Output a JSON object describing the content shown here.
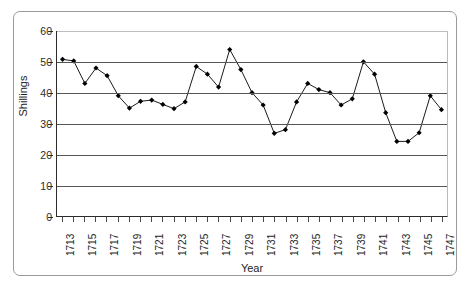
{
  "chart_data": {
    "type": "line",
    "title": "",
    "xlabel": "Year",
    "ylabel": "Shillings",
    "xlim": [
      1712.5,
      1747.5
    ],
    "ylim": [
      0,
      60
    ],
    "grid": true,
    "legend": false,
    "marker": "diamond",
    "line_color": "#000000",
    "marker_color": "#000000",
    "y_ticks": [
      0,
      10,
      20,
      30,
      40,
      50,
      60
    ],
    "y_tick_labels": [
      "0",
      "10",
      "20",
      "30",
      "40",
      "50",
      "60"
    ],
    "x_tick_labels": [
      "1713",
      "1715",
      "1717",
      "1719",
      "1721",
      "1723",
      "1725",
      "1727",
      "1729",
      "1731",
      "1733",
      "1735",
      "1737",
      "1739",
      "1741",
      "1743",
      "1745",
      "1747"
    ],
    "x": [
      1713,
      1714,
      1715,
      1716,
      1717,
      1718,
      1719,
      1720,
      1721,
      1722,
      1723,
      1724,
      1725,
      1726,
      1727,
      1728,
      1729,
      1730,
      1731,
      1732,
      1733,
      1734,
      1735,
      1736,
      1737,
      1738,
      1739,
      1740,
      1741,
      1742,
      1743,
      1744,
      1745,
      1746,
      1747
    ],
    "values": [
      50.8,
      50.3,
      43.0,
      48.0,
      45.5,
      39.0,
      35.0,
      37.2,
      37.6,
      36.2,
      34.8,
      37.0,
      48.5,
      46.0,
      41.8,
      54.0,
      47.5,
      40.0,
      36.0,
      26.8,
      28.0,
      37.0,
      43.0,
      41.0,
      40.0,
      36.0,
      38.0,
      50.0,
      46.0,
      33.5,
      24.2,
      24.2,
      27.0,
      39.0,
      34.5
    ]
  },
  "axes": {
    "y_title": "Shillings",
    "x_title": "Year"
  }
}
